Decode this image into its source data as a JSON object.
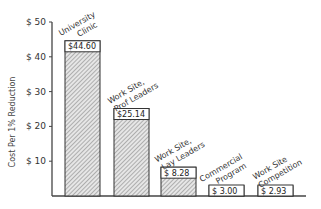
{
  "chart_data": {
    "type": "bar",
    "title": "",
    "xlabel": "",
    "ylabel": "Cost Per 1% Reduction",
    "ylim": [
      0,
      50
    ],
    "yticks": [
      {
        "value": 10,
        "label": "$ 10"
      },
      {
        "value": 20,
        "label": "$ 20"
      },
      {
        "value": 30,
        "label": "$ 30"
      },
      {
        "value": 40,
        "label": "$ 40"
      },
      {
        "value": 50,
        "label": "$ 50"
      }
    ],
    "grid": false,
    "legend": null,
    "categories": [
      [
        "University",
        "Clinic"
      ],
      [
        "Work Site,",
        "Prof Leaders"
      ],
      [
        "Work Site,",
        "Lay Leaders"
      ],
      [
        "Commercial",
        "Program"
      ],
      [
        "Work Site",
        "Competition"
      ]
    ],
    "values": [
      44.6,
      25.14,
      8.28,
      3.0,
      2.93
    ],
    "value_labels": [
      "$44.60",
      "$25.14",
      "$ 8.28",
      "$ 3.00",
      "$ 2.93"
    ],
    "bar_fill": "hatched"
  }
}
